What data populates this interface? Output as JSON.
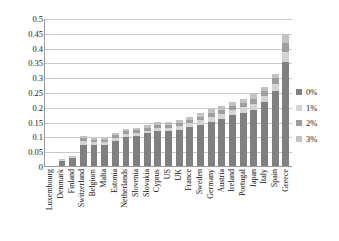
{
  "chart_data": {
    "type": "bar",
    "stacked": true,
    "title": "",
    "subtitle": "",
    "xlabel": "",
    "ylabel": "",
    "ylim": [
      0,
      0.5
    ],
    "grid": true,
    "legend_position": "right",
    "ytick_labels": [
      "0.5",
      "0.45",
      "0.4",
      "0.35",
      "0.3",
      "0.25",
      "0.2",
      "0.15",
      "0.1",
      "0.05",
      "0"
    ],
    "ytick_values": [
      0.5,
      0.45,
      0.4,
      0.35,
      0.3,
      0.25,
      0.2,
      0.15,
      0.1,
      0.05,
      0
    ],
    "categories": [
      "Luxembourg",
      "Denmark",
      "Finland",
      "Switzerland",
      "Belgium",
      "Malta",
      "Estonia",
      "Netherlands",
      "Slovenia",
      "Slovakia",
      "Cyprus",
      "US",
      "UK",
      "France",
      "Sweden",
      "Germany",
      "Austria",
      "Ireland",
      "Portugal",
      "Japan",
      "Italy",
      "Spain",
      "Greece"
    ],
    "series": [
      {
        "name": "0%",
        "color": "#808080",
        "values": [
          0.0,
          0.018,
          0.028,
          0.072,
          0.07,
          0.07,
          0.083,
          0.098,
          0.1,
          0.11,
          0.118,
          0.118,
          0.122,
          0.132,
          0.14,
          0.15,
          0.16,
          0.172,
          0.18,
          0.19,
          0.215,
          0.255,
          0.35
        ]
      },
      {
        "name": "1%",
        "color": "#d4d4d4",
        "values": [
          0.0,
          0.002,
          0.002,
          0.012,
          0.01,
          0.01,
          0.012,
          0.01,
          0.012,
          0.01,
          0.012,
          0.012,
          0.012,
          0.013,
          0.014,
          0.016,
          0.016,
          0.017,
          0.018,
          0.02,
          0.02,
          0.022,
          0.035
        ]
      },
      {
        "name": "2%",
        "color": "#9e9e9e",
        "values": [
          0.0,
          0.002,
          0.002,
          0.01,
          0.008,
          0.008,
          0.01,
          0.01,
          0.01,
          0.01,
          0.01,
          0.01,
          0.011,
          0.012,
          0.013,
          0.014,
          0.014,
          0.015,
          0.016,
          0.018,
          0.018,
          0.019,
          0.03
        ]
      },
      {
        "name": "3%",
        "color": "#c2c2c2",
        "values": [
          0.0,
          0.001,
          0.001,
          0.008,
          0.007,
          0.007,
          0.008,
          0.008,
          0.008,
          0.008,
          0.009,
          0.009,
          0.009,
          0.01,
          0.011,
          0.012,
          0.012,
          0.013,
          0.014,
          0.015,
          0.015,
          0.016,
          0.03
        ]
      }
    ],
    "totals": [
      0.0,
      0.023,
      0.033,
      0.102,
      0.095,
      0.095,
      0.113,
      0.126,
      0.13,
      0.138,
      0.149,
      0.149,
      0.154,
      0.167,
      0.178,
      0.192,
      0.202,
      0.217,
      0.228,
      0.243,
      0.268,
      0.312,
      0.445
    ]
  },
  "legend": {
    "items": [
      {
        "label": "0%",
        "color": "#808080"
      },
      {
        "label": "1%",
        "color": "#d4d4d4"
      },
      {
        "label": "2%",
        "color": "#9e9e9e"
      },
      {
        "label": "3%",
        "color": "#c2c2c2"
      }
    ]
  }
}
